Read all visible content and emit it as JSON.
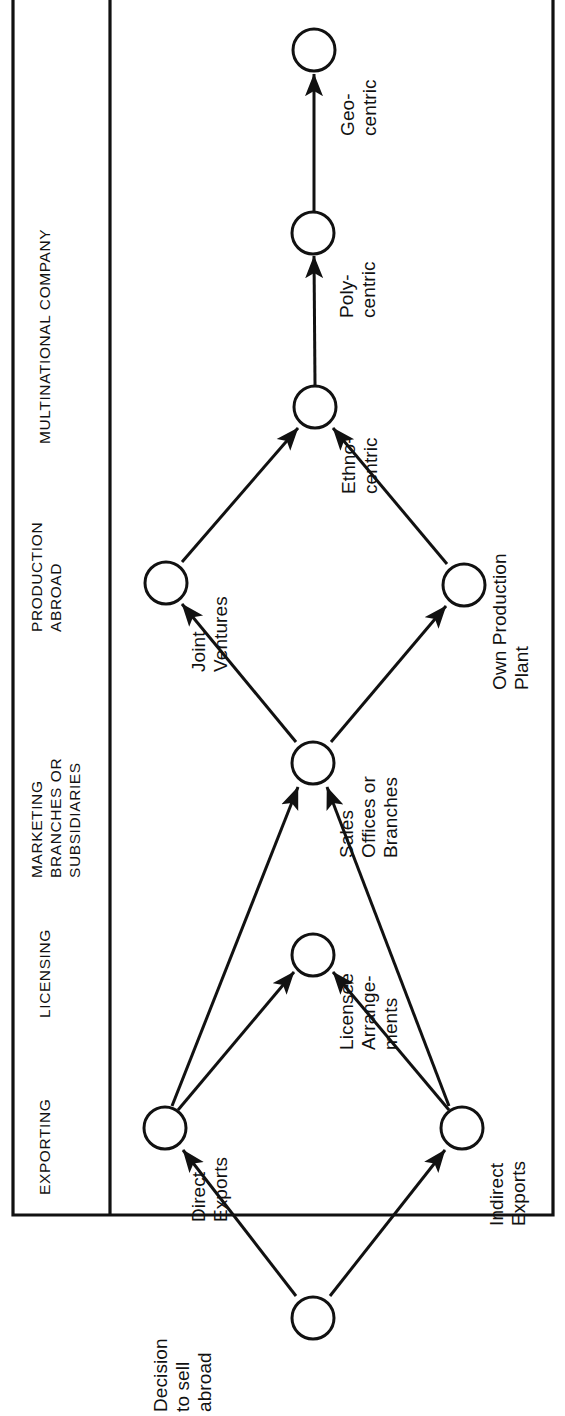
{
  "figure": {
    "orientation": "rotated-90-ccw",
    "type": "flow-diagram",
    "ink_color": "#111111",
    "background_color": "#ffffff"
  },
  "header": {
    "columns": [
      {
        "id": "exporting",
        "lines": [
          "EXPORTING"
        ]
      },
      {
        "id": "licensing",
        "lines": [
          "LICENSING"
        ]
      },
      {
        "id": "marketing",
        "lines": [
          "MARKETING",
          "BRANCHES OR",
          "SUBSIDIARIES"
        ]
      },
      {
        "id": "production",
        "lines": [
          "PRODUCTION",
          "ABROAD"
        ]
      },
      {
        "id": "multinational",
        "lines": [
          "MULTINATIONAL COMPANY"
        ]
      }
    ]
  },
  "nodes": [
    {
      "id": "decision",
      "lines": [
        "Decision",
        "to sell",
        "abroad"
      ]
    },
    {
      "id": "direct-exports",
      "lines": [
        "Direct",
        "Exports"
      ]
    },
    {
      "id": "indirect-exports",
      "lines": [
        "Indirect",
        "Exports"
      ]
    },
    {
      "id": "licensee",
      "lines": [
        "Licensee",
        "Arrange-",
        "ments"
      ]
    },
    {
      "id": "sales-offices",
      "lines": [
        "Sales",
        "Offices or",
        "Branches"
      ]
    },
    {
      "id": "joint-ventures",
      "lines": [
        "Joint",
        "Ventures"
      ]
    },
    {
      "id": "own-production",
      "lines": [
        "Own Production",
        "Plant"
      ]
    },
    {
      "id": "ethnocentric",
      "lines": [
        "Ethno-",
        "centric"
      ]
    },
    {
      "id": "polycentric",
      "lines": [
        "Poly-",
        "centric"
      ]
    },
    {
      "id": "geocentric",
      "lines": [
        "Geo-",
        "centric"
      ]
    }
  ],
  "edges": [
    {
      "from": "decision",
      "to": "direct-exports"
    },
    {
      "from": "decision",
      "to": "indirect-exports"
    },
    {
      "from": "direct-exports",
      "to": "licensee"
    },
    {
      "from": "direct-exports",
      "to": "sales-offices"
    },
    {
      "from": "indirect-exports",
      "to": "licensee"
    },
    {
      "from": "indirect-exports",
      "to": "sales-offices"
    },
    {
      "from": "sales-offices",
      "to": "joint-ventures"
    },
    {
      "from": "sales-offices",
      "to": "own-production"
    },
    {
      "from": "joint-ventures",
      "to": "ethnocentric"
    },
    {
      "from": "own-production",
      "to": "ethnocentric"
    },
    {
      "from": "ethnocentric",
      "to": "polycentric"
    },
    {
      "from": "polycentric",
      "to": "geocentric"
    }
  ],
  "labels": {
    "h_exporting": "EXPORTING",
    "h_licensing": "LICENSING",
    "h_marketing_1": "MARKETING",
    "h_marketing_2": "BRANCHES OR",
    "h_marketing_3": "SUBSIDIARIES",
    "h_production_1": "PRODUCTION",
    "h_production_2": "ABROAD",
    "h_multinational": "MULTINATIONAL COMPANY",
    "n_decision_1": "Decision",
    "n_decision_2": "to sell",
    "n_decision_3": "abroad",
    "n_direct_1": "Direct",
    "n_direct_2": "Exports",
    "n_indirect_1": "Indirect",
    "n_indirect_2": "Exports",
    "n_licensee_1": "Licensee",
    "n_licensee_2": "Arrange-",
    "n_licensee_3": "ments",
    "n_sales_1": "Sales",
    "n_sales_2": "Offices or",
    "n_sales_3": "Branches",
    "n_joint_1": "Joint",
    "n_joint_2": "Ventures",
    "n_own_1": "Own Production",
    "n_own_2": "Plant",
    "n_ethno_1": "Ethno-",
    "n_ethno_2": "centric",
    "n_poly_1": "Poly-",
    "n_poly_2": "centric",
    "n_geo_1": "Geo-",
    "n_geo_2": "centric"
  }
}
